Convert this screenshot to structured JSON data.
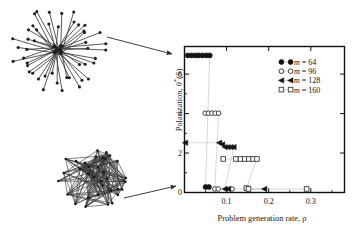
{
  "figure": {
    "title": "",
    "network_panels": [
      {
        "name": "star-network",
        "description": "hub-and-spoke star network",
        "nodes": 46,
        "layout": "radial"
      },
      {
        "name": "mesh-network",
        "description": "dense random mesh network",
        "nodes": 34,
        "layout": "clustered"
      }
    ],
    "annotations": [
      {
        "name": "arrow-star-to-plot"
      },
      {
        "name": "arrow-mesh-to-plot"
      }
    ]
  },
  "chart_data": {
    "type": "scatter",
    "title": "",
    "xlabel": "Problem generation rate, ρ",
    "ylabel_text": "Polarization, θ*(S)",
    "ylabel_main": "Polarization, ",
    "ylabel_symbol": "θ",
    "ylabel_star": "*",
    "ylabel_arg": "(S)",
    "xlim": [
      0.0,
      0.38
    ],
    "ylim": [
      0.0,
      7.4
    ],
    "xticks": [
      0.1,
      0.2,
      0.3
    ],
    "xticklabels": [
      "0.1",
      "0.2",
      "0.3"
    ],
    "yticks": [
      0,
      2,
      4,
      6
    ],
    "yticklabels": [
      "0",
      "2",
      "4",
      "6"
    ],
    "grid": false,
    "legend_position": "top-right",
    "series": [
      {
        "name": "m = 64",
        "label": "m = 64",
        "m": 64,
        "marker": "filled-circle",
        "color": "#141414",
        "x": [
          0.008,
          0.017,
          0.026,
          0.034,
          0.043,
          0.052,
          0.06,
          0.05,
          0.058
        ],
        "y": [
          6.95,
          6.95,
          6.95,
          6.95,
          6.95,
          6.95,
          6.95,
          0.28,
          0.28
        ]
      },
      {
        "name": "m = 96",
        "label": "m = 96",
        "m": 96,
        "marker": "open-circle",
        "color": "#2b2b2b",
        "x": [
          0.049,
          0.057,
          0.065,
          0.073,
          0.081,
          0.072,
          0.08,
          0.113
        ],
        "y": [
          4.02,
          4.02,
          4.02,
          4.02,
          4.02,
          0.18,
          0.18,
          0.18
        ]
      },
      {
        "name": "m = 128",
        "label": "m = 128",
        "m": 128,
        "marker": "left-triangle",
        "color": "#141414",
        "x": [
          0.002,
          0.083,
          0.09,
          0.096,
          0.103,
          0.11,
          0.117,
          0.096,
          0.104,
          0.19
        ],
        "y": [
          2.52,
          2.52,
          2.44,
          2.3,
          2.3,
          2.3,
          2.3,
          0.18,
          0.18,
          0.18
        ]
      },
      {
        "name": "m = 160",
        "label": "m = 160",
        "m": 160,
        "marker": "open-square",
        "color": "#3a3a3a",
        "x": [
          0.092,
          0.122,
          0.133,
          0.143,
          0.153,
          0.163,
          0.172,
          0.147,
          0.152,
          0.29
        ],
        "y": [
          1.7,
          1.7,
          1.7,
          1.7,
          1.7,
          1.7,
          1.7,
          0.22,
          0.18,
          0.18
        ]
      }
    ],
    "legend": [
      {
        "label": "m = 64",
        "marker": "filled-circle",
        "m": "64"
      },
      {
        "label": "m = 96",
        "marker": "open-circle",
        "m": "96"
      },
      {
        "label": "m = 128",
        "marker": "left-triangle",
        "m": "128"
      },
      {
        "label": "m = 160",
        "marker": "open-square",
        "m": "160"
      }
    ],
    "legend_symbol": "m",
    "legend_eq": "=",
    "legend_values": [
      "64",
      "96",
      "128",
      "160"
    ]
  }
}
